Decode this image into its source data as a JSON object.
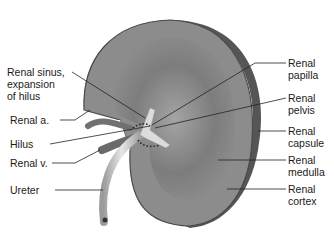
{
  "figure": {
    "colors": {
      "cortex": "#8a8a8a",
      "medulla": "#6e6e6e",
      "outline": "#4a4a4a",
      "pelvis": "#d8d8d8",
      "ureter": "#c8c8c8",
      "leader_line": "#222222"
    }
  },
  "labels_left": [
    {
      "id": "renal-sinus",
      "text": "Renal sinus,\nexpansion\nof hilus"
    },
    {
      "id": "renal-artery",
      "text": "Renal a."
    },
    {
      "id": "hilus",
      "text": "Hilus"
    },
    {
      "id": "renal-vein",
      "text": "Renal v."
    },
    {
      "id": "ureter",
      "text": "Ureter"
    }
  ],
  "labels_right": [
    {
      "id": "renal-papilla",
      "text": "Renal\npapilla"
    },
    {
      "id": "renal-pelvis",
      "text": "Renal\npelvis"
    },
    {
      "id": "renal-capsule",
      "text": "Renal\ncapsule"
    },
    {
      "id": "renal-medulla",
      "text": "Renal\nmedulla"
    },
    {
      "id": "renal-cortex",
      "text": "Renal\ncortex"
    }
  ]
}
